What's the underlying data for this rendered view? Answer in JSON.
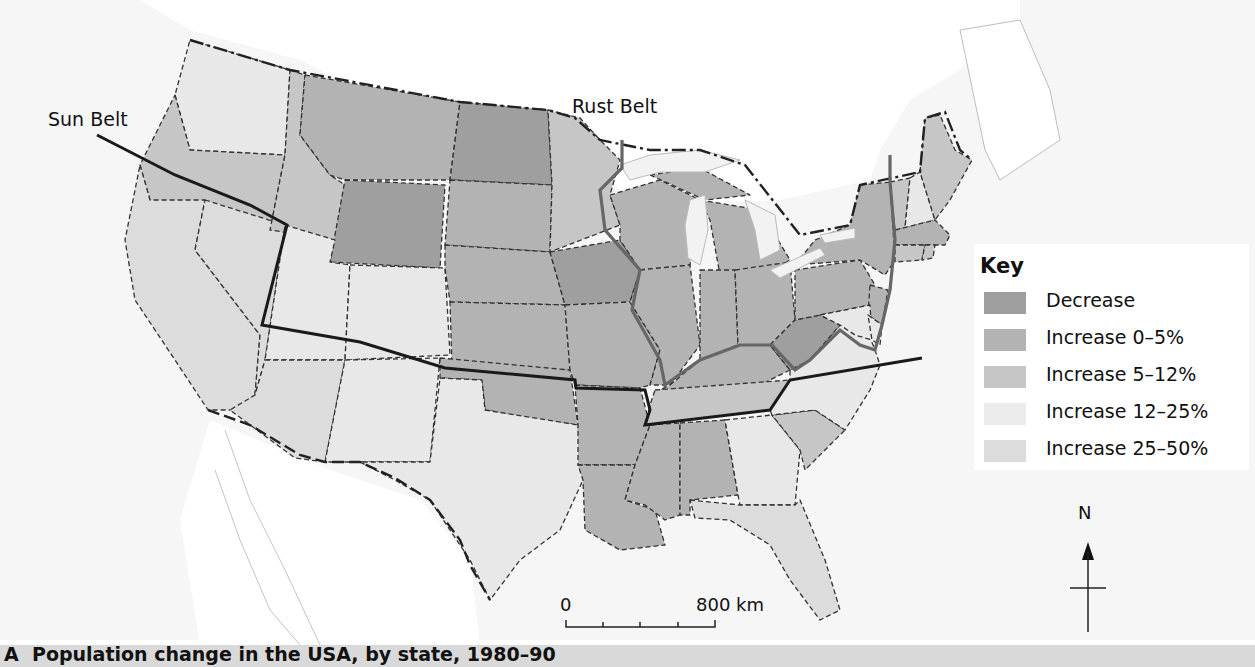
{
  "figure": {
    "caption_letter": "A",
    "caption": "Population change in the USA, by state, 1980–90"
  },
  "labels": {
    "sun_belt": "Sun Belt",
    "rust_belt": "Rust Belt"
  },
  "key": {
    "title": "Key",
    "items": [
      {
        "label": "Decrease",
        "color": "#9f9f9f"
      },
      {
        "label": "Increase 0–5%",
        "color": "#b3b3b3"
      },
      {
        "label": "Increase 5–12%",
        "color": "#c6c6c6"
      },
      {
        "label": "Increase 12–25%",
        "color": "#e8e8e8"
      },
      {
        "label": "Increase 25–50%",
        "color": "#dcdcdc"
      }
    ]
  },
  "scale_bar": {
    "start": "0",
    "end": "800 km"
  },
  "north_arrow": {
    "label": "N"
  },
  "colors": {
    "outline": "#1a1a1a",
    "rust_belt_line": "#555555",
    "land_outside": "#ffffff",
    "sea": "#f6f6f6"
  },
  "states": [
    {
      "name": "Washington",
      "class": "Increase 12–25%"
    },
    {
      "name": "Oregon",
      "class": "Increase 5–12%"
    },
    {
      "name": "California",
      "class": "Increase 25–50%"
    },
    {
      "name": "Nevada",
      "class": "Increase 25–50%"
    },
    {
      "name": "Idaho",
      "class": "Increase 5–12%"
    },
    {
      "name": "Montana",
      "class": "Increase 0–5%"
    },
    {
      "name": "Wyoming",
      "class": "Decrease"
    },
    {
      "name": "Utah",
      "class": "Increase 12–25%"
    },
    {
      "name": "Arizona",
      "class": "Increase 25–50%"
    },
    {
      "name": "Colorado",
      "class": "Increase 12–25%"
    },
    {
      "name": "New Mexico",
      "class": "Increase 12–25%"
    },
    {
      "name": "North Dakota",
      "class": "Decrease"
    },
    {
      "name": "South Dakota",
      "class": "Increase 0–5%"
    },
    {
      "name": "Nebraska",
      "class": "Increase 0–5%"
    },
    {
      "name": "Kansas",
      "class": "Increase 0–5%"
    },
    {
      "name": "Oklahoma",
      "class": "Increase 0–5%"
    },
    {
      "name": "Texas",
      "class": "Increase 12–25%"
    },
    {
      "name": "Minnesota",
      "class": "Increase 5–12%"
    },
    {
      "name": "Iowa",
      "class": "Decrease"
    },
    {
      "name": "Missouri",
      "class": "Increase 0–5%"
    },
    {
      "name": "Arkansas",
      "class": "Increase 0–5%"
    },
    {
      "name": "Louisiana",
      "class": "Increase 0–5%"
    },
    {
      "name": "Wisconsin",
      "class": "Increase 0–5%"
    },
    {
      "name": "Illinois",
      "class": "Increase 0–5%"
    },
    {
      "name": "Michigan",
      "class": "Increase 0–5%"
    },
    {
      "name": "Indiana",
      "class": "Increase 0–5%"
    },
    {
      "name": "Ohio",
      "class": "Increase 0–5%"
    },
    {
      "name": "Kentucky",
      "class": "Increase 0–5%"
    },
    {
      "name": "Tennessee",
      "class": "Increase 5–12%"
    },
    {
      "name": "Mississippi",
      "class": "Increase 0–5%"
    },
    {
      "name": "Alabama",
      "class": "Increase 0–5%"
    },
    {
      "name": "Georgia",
      "class": "Increase 12–25%"
    },
    {
      "name": "Florida",
      "class": "Increase 25–50%"
    },
    {
      "name": "South Carolina",
      "class": "Increase 5–12%"
    },
    {
      "name": "North Carolina",
      "class": "Increase 12–25%"
    },
    {
      "name": "Virginia",
      "class": "Increase 12–25%"
    },
    {
      "name": "West Virginia",
      "class": "Decrease"
    },
    {
      "name": "Pennsylvania",
      "class": "Increase 0–5%"
    },
    {
      "name": "New York",
      "class": "Increase 0–5%"
    },
    {
      "name": "New Jersey",
      "class": "Increase 0–5%"
    },
    {
      "name": "Maryland",
      "class": "Increase 12–25%"
    },
    {
      "name": "Delaware",
      "class": "Increase 12–25%"
    },
    {
      "name": "Vermont",
      "class": "Increase 5–12%"
    },
    {
      "name": "New Hampshire",
      "class": "Increase 12–25%"
    },
    {
      "name": "Maine",
      "class": "Increase 5–12%"
    },
    {
      "name": "Massachusetts",
      "class": "Increase 0–5%"
    },
    {
      "name": "Connecticut",
      "class": "Increase 5–12%"
    },
    {
      "name": "Rhode Island",
      "class": "Increase 5–12%"
    }
  ]
}
